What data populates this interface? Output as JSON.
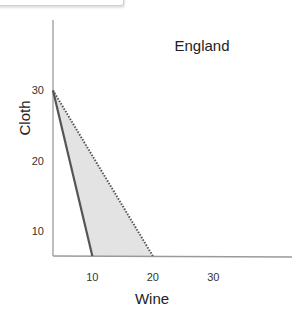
{
  "chart_data": {
    "type": "area",
    "title": "England",
    "xlabel": "Wine",
    "ylabel": "Cloth",
    "x_ticks": [
      10,
      20,
      30
    ],
    "y_ticks": [
      10,
      20,
      30
    ],
    "xlim": [
      3.5,
      43
    ],
    "ylim": [
      6.5,
      40
    ],
    "grid": false,
    "series": [
      {
        "name": "production-possibility-frontier",
        "style": "solid",
        "color": "#555555",
        "points": [
          [
            3.5,
            30
          ],
          [
            10,
            6.5
          ]
        ]
      },
      {
        "name": "trade-possibility-frontier",
        "style": "dotted",
        "color": "#555555",
        "points": [
          [
            3.5,
            30
          ],
          [
            20,
            6.5
          ]
        ]
      }
    ],
    "shaded_region": {
      "name": "gains-from-trade",
      "color": "#e3e3e3",
      "points": [
        [
          3.5,
          30
        ],
        [
          10,
          6.5
        ],
        [
          20,
          6.5
        ]
      ]
    }
  }
}
